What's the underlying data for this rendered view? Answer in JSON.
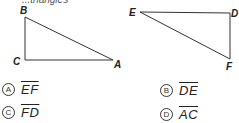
{
  "header_fragment": "...triangles",
  "figures": {
    "triangle_1": {
      "vertices": [
        {
          "label": "B",
          "x": 25,
          "y": 17
        },
        {
          "label": "C",
          "x": 25,
          "y": 60
        },
        {
          "label": "A",
          "x": 113,
          "y": 60
        }
      ],
      "right_angle_at": "C"
    },
    "triangle_2": {
      "vertices": [
        {
          "label": "E",
          "x": 140,
          "y": 12
        },
        {
          "label": "D",
          "x": 230,
          "y": 13
        },
        {
          "label": "F",
          "x": 230,
          "y": 59
        }
      ],
      "right_angle_at": "D"
    }
  },
  "options": [
    {
      "letter": "A",
      "segment": "EF"
    },
    {
      "letter": "B",
      "segment": "DE"
    },
    {
      "letter": "C",
      "segment": "FD"
    },
    {
      "letter": "D",
      "segment": "AC"
    }
  ],
  "colors": {
    "line": "#333333",
    "text": "#222222",
    "background": "#ffffff"
  }
}
